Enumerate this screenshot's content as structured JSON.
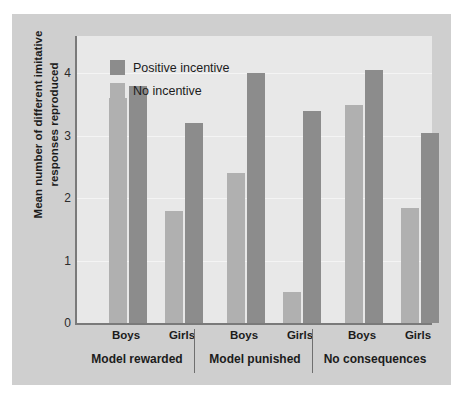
{
  "chart_data": {
    "type": "bar",
    "title": "",
    "xlabel": "",
    "ylabel": "Mean number of different imitative responses reproduced",
    "ylim": [
      0,
      4.6
    ],
    "yticks": [
      0,
      1,
      2,
      3,
      4
    ],
    "ytick_labels": [
      "0",
      "1",
      "2",
      "3",
      "4"
    ],
    "grid": true,
    "legend_position": "top-left",
    "groups": [
      {
        "name": "Model rewarded",
        "subgroups": [
          {
            "name": "Boys",
            "no_incentive": 3.6,
            "positive_incentive": 3.8
          },
          {
            "name": "Girls",
            "no_incentive": 1.8,
            "positive_incentive": 3.2
          }
        ]
      },
      {
        "name": "Model punished",
        "subgroups": [
          {
            "name": "Boys",
            "no_incentive": 2.4,
            "positive_incentive": 4.0
          },
          {
            "name": "Girls",
            "no_incentive": 0.5,
            "positive_incentive": 3.4
          }
        ]
      },
      {
        "name": "No consequences",
        "subgroups": [
          {
            "name": "Boys",
            "no_incentive": 3.5,
            "positive_incentive": 4.05
          },
          {
            "name": "Girls",
            "no_incentive": 1.85,
            "positive_incentive": 3.05
          }
        ]
      }
    ],
    "categories": [
      "Model rewarded - Boys",
      "Model rewarded - Girls",
      "Model punished - Boys",
      "Model punished - Girls",
      "No consequences - Boys",
      "No consequences - Girls"
    ],
    "series": [
      {
        "name": "No incentive",
        "color": "#b0b0b0",
        "values": [
          3.6,
          1.8,
          2.4,
          0.5,
          3.5,
          1.85
        ]
      },
      {
        "name": "Positive incentive",
        "color": "#8c8c8c",
        "values": [
          3.8,
          3.2,
          4.0,
          3.4,
          4.05,
          3.05
        ]
      }
    ]
  },
  "legend": {
    "items": [
      {
        "label": "Positive incentive",
        "color": "#8c8c8c"
      },
      {
        "label": "No incentive",
        "color": "#b0b0b0"
      }
    ]
  },
  "colors": {
    "figure_background": "#cfcfcf",
    "plot_background": "#e8e8e8",
    "axis": "#7a7a7a",
    "gridline": "#f4f4f4",
    "text": "#1c1c1c"
  }
}
